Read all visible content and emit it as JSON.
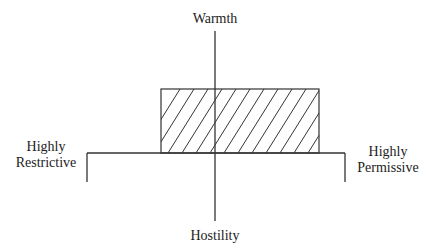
{
  "diagram": {
    "labels": {
      "top": "Warmth",
      "bottom": "Hostility",
      "left_line1": "Highly",
      "left_line2": "Restrictive",
      "right_line1": "Highly",
      "right_line2": "Permissive"
    },
    "axes": {
      "vertical": {
        "x": 215,
        "y1": 31,
        "y2": 221
      },
      "horizontal": {
        "y": 153,
        "x1": 87,
        "x2": 345
      },
      "left_tick": {
        "x": 87,
        "y1": 153,
        "y2": 182
      },
      "right_tick": {
        "x": 345,
        "y1": 153,
        "y2": 182
      }
    },
    "region": {
      "x": 161,
      "y": 89,
      "width": 158,
      "height": 64,
      "fill": "diagonal-hatch"
    },
    "colors": {
      "line": "#333333",
      "hatch": "#333333"
    }
  }
}
